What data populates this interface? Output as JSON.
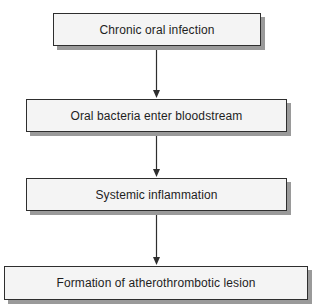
{
  "diagram": {
    "type": "flowchart",
    "direction": "top-to-bottom",
    "nodes": [
      {
        "id": "n1",
        "label": "Chronic oral infection"
      },
      {
        "id": "n2",
        "label": "Oral bacteria enter bloodstream"
      },
      {
        "id": "n3",
        "label": "Systemic inflammation"
      },
      {
        "id": "n4",
        "label": "Formation of atherothrombotic lesion"
      }
    ],
    "edges": [
      {
        "from": "n1",
        "to": "n2"
      },
      {
        "from": "n2",
        "to": "n3"
      },
      {
        "from": "n3",
        "to": "n4"
      }
    ],
    "colors": {
      "box_fill": "#f4f4f4",
      "box_border": "#2e2e2e",
      "box_shadow": "#9a9a9a",
      "arrow": "#2e2e2e",
      "text": "#1e1e1e"
    }
  }
}
